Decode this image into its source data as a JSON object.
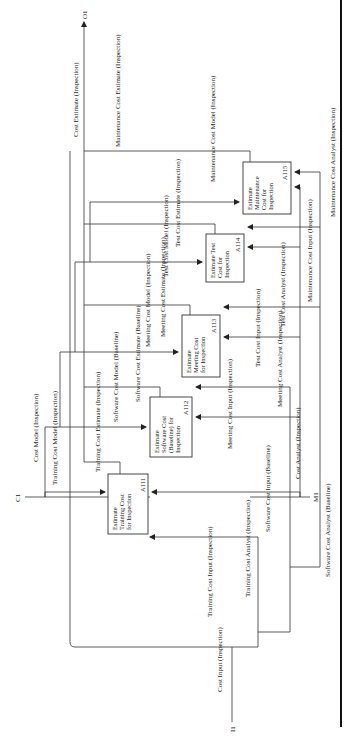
{
  "diagram": {
    "type": "IDEF0",
    "boundary": {
      "inputs": [
        {
          "code": "I1",
          "label": "Cost Input (Inspection)"
        }
      ],
      "controls": [
        {
          "code": "C1",
          "label": "Cost Model (Inspection)"
        }
      ],
      "mechanisms": [
        {
          "code": "M1",
          "label": "Cost Analyst (Inspection)"
        }
      ],
      "outputs": [
        {
          "code": "O1",
          "label": "Cost Estimate (Inspection)"
        }
      ]
    },
    "activities": [
      {
        "id": "A111",
        "line1": "Estimate",
        "line2": "Training Cost",
        "line3": "for Inspection",
        "line4": ""
      },
      {
        "id": "A112",
        "line1": "Estimate",
        "line2": "Software Cost",
        "line3": "(Baseline) for",
        "line4": "Inspection"
      },
      {
        "id": "A113",
        "line1": "Estimate",
        "line2": "Meeting Cost",
        "line3": "for Inspection",
        "line4": ""
      },
      {
        "id": "A114",
        "line1": "Estimate Test",
        "line2": "Cost for",
        "line3": "Inspection",
        "line4": ""
      },
      {
        "id": "A115",
        "line1": "Estimate",
        "line2": "Maintenance",
        "line3": "Cost for",
        "line4": "Inspection"
      }
    ],
    "arrows": {
      "training_cost_input": "Training Cost Input (Inspection)",
      "training_cost_model": "Training Cost Model (Inspection)",
      "training_cost_analyst": "Training Cost Analyst (Inspection)",
      "training_cost_estimate": "Training Cost Estimate (Inspection)",
      "software_cost_input": "Software Cost Input (Baseline)",
      "software_cost_model": "Software Cost Model (Baseline)",
      "software_cost_analyst": "Software Cost Analyst (Baseline)",
      "software_cost_estimate": "Software Cost Estimate (Baseline)",
      "meeting_cost_input": "Meeting Cost Input (Inspection)",
      "meeting_cost_model": "Meeting Cost Model (Inspection)",
      "meeting_cost_analyst": "Meeting Cost Analyst (Inspection)",
      "meeting_cost_estimate": "Meeting Cost Estimate (Inspection)",
      "test_cost_input": "Test Cost Input (Inspection)",
      "test_cost_model": "Test Cost Model (Inspection)",
      "test_cost_analyst": "Test Cost Analyst (Inspection)",
      "test_cost_estimate": "Test Cost Estimate (Inspection)",
      "maintenance_cost_input": "Maintenance Cost Input (Inspection)",
      "maintenance_cost_model": "Maintenance Cost Model (Inspection)",
      "maintenance_cost_analyst": "Maintenance Cost Analyst (Inspection)",
      "maintenance_cost_estimate": "Maintenance Cost Estimate (Inspection)"
    }
  }
}
